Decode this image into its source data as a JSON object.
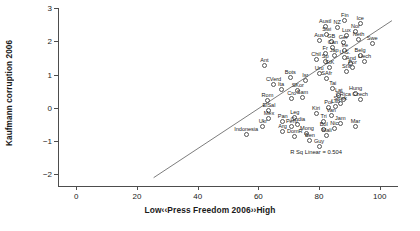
{
  "chart_data": {
    "type": "scatter",
    "title": "",
    "xlabel": "Low‹‹Press Freedom 2006››High",
    "ylabel": "Kaufmann corruption 2006",
    "xlim": [
      -6,
      106
    ],
    "ylim": [
      -2.35,
      3.0
    ],
    "xticks": [
      0,
      20,
      40,
      60,
      80,
      100
    ],
    "yticks": [
      -2,
      -1,
      0,
      1,
      2,
      3
    ],
    "grid": false,
    "legend": null,
    "annotations": [
      {
        "text": "R Sq Linear = 0.504",
        "x": 79,
        "y": -1.32
      }
    ],
    "fit": {
      "type": "linear",
      "r_squared": 0.504,
      "x_start": 25.5,
      "y_start": -2.1,
      "x_end": 104,
      "y_end": 2.62
    },
    "points": [
      {
        "label": "Fin",
        "x": 88.5,
        "y": 2.62
      },
      {
        "label": "Ice",
        "x": 93.5,
        "y": 2.54
      },
      {
        "label": "Nor",
        "x": 92.0,
        "y": 2.3
      },
      {
        "label": "NZ",
        "x": 86.0,
        "y": 2.4
      },
      {
        "label": "Austl",
        "x": 82.0,
        "y": 2.45
      },
      {
        "label": "Swi",
        "x": 82.5,
        "y": 2.2
      },
      {
        "label": "Lux",
        "x": 89.0,
        "y": 2.18
      },
      {
        "label": "Neth",
        "x": 93.0,
        "y": 2.05
      },
      {
        "label": "Ger",
        "x": 88.0,
        "y": 1.96
      },
      {
        "label": "GB",
        "x": 84.0,
        "y": 1.98
      },
      {
        "label": "Aus",
        "x": 80.0,
        "y": 2.02
      },
      {
        "label": "Swe",
        "x": 97.5,
        "y": 1.92
      },
      {
        "label": "Can",
        "x": 84.5,
        "y": 1.8
      },
      {
        "label": "Ire",
        "x": 88.5,
        "y": 1.72
      },
      {
        "label": "Fr",
        "x": 82.0,
        "y": 1.62
      },
      {
        "label": "Jap",
        "x": 85.0,
        "y": 1.58
      },
      {
        "label": "U.S.",
        "x": 88.5,
        "y": 1.52
      },
      {
        "label": "Belg",
        "x": 93.5,
        "y": 1.58
      },
      {
        "label": "Liech",
        "x": 95.0,
        "y": 1.4
      },
      {
        "label": "And",
        "x": 90.5,
        "y": 1.34
      },
      {
        "label": "Por",
        "x": 91.0,
        "y": 1.2
      },
      {
        "label": "StV",
        "x": 89.0,
        "y": 1.1
      },
      {
        "label": "Sp",
        "x": 82.0,
        "y": 1.38
      },
      {
        "label": "Chil",
        "x": 79.0,
        "y": 1.44
      },
      {
        "label": "StK",
        "x": 83.5,
        "y": 1.22
      },
      {
        "label": "Ant",
        "x": 62.0,
        "y": 1.26
      },
      {
        "label": "Uru",
        "x": 80.0,
        "y": 1.02
      },
      {
        "label": "SAfr",
        "x": 82.5,
        "y": 0.88
      },
      {
        "label": "Isr",
        "x": 75.5,
        "y": 0.82
      },
      {
        "label": "Bots",
        "x": 70.5,
        "y": 0.92
      },
      {
        "label": "CVerd",
        "x": 65.0,
        "y": 0.7
      },
      {
        "label": "Ita",
        "x": 67.5,
        "y": 0.55
      },
      {
        "label": "SKor",
        "x": 73.0,
        "y": 0.52
      },
      {
        "label": "Tai",
        "x": 84.5,
        "y": 0.58
      },
      {
        "label": "Lat",
        "x": 86.5,
        "y": 0.36
      },
      {
        "label": "Hung",
        "x": 92.0,
        "y": 0.42
      },
      {
        "label": "Czech",
        "x": 93.5,
        "y": 0.26
      },
      {
        "label": "CRica",
        "x": 88.0,
        "y": 0.24
      },
      {
        "label": "Slovk",
        "x": 87.0,
        "y": 0.12
      },
      {
        "label": "Lith",
        "x": 85.5,
        "y": 0.04
      },
      {
        "label": "Pol",
        "x": 83.0,
        "y": 0.0
      },
      {
        "label": "Sam",
        "x": 74.5,
        "y": 0.3
      },
      {
        "label": "Cro",
        "x": 71.0,
        "y": 0.28
      },
      {
        "label": "Rom",
        "x": 63.0,
        "y": 0.22
      },
      {
        "label": "ElSal",
        "x": 63.5,
        "y": -0.08
      },
      {
        "label": "Kiri",
        "x": 79.0,
        "y": -0.16
      },
      {
        "label": "Van",
        "x": 84.0,
        "y": -0.22
      },
      {
        "label": "Tri",
        "x": 81.5,
        "y": -0.42
      },
      {
        "label": "Jam",
        "x": 87.0,
        "y": -0.46
      },
      {
        "label": "Mar",
        "x": 92.0,
        "y": -0.56
      },
      {
        "label": "Nic",
        "x": 85.0,
        "y": -0.62
      },
      {
        "label": "Bol",
        "x": 81.5,
        "y": -0.64
      },
      {
        "label": "Mali",
        "x": 82.5,
        "y": -0.82
      },
      {
        "label": "Mong",
        "x": 76.0,
        "y": -0.78
      },
      {
        "label": "Ben",
        "x": 77.0,
        "y": -0.98
      },
      {
        "label": "Guy",
        "x": 80.0,
        "y": -1.16
      },
      {
        "label": "Mex",
        "x": 63.5,
        "y": -0.32
      },
      {
        "label": "Pan",
        "x": 68.0,
        "y": -0.4
      },
      {
        "label": "Leg",
        "x": 72.0,
        "y": -0.3
      },
      {
        "label": "Gndia",
        "x": 73.0,
        "y": -0.5
      },
      {
        "label": "Peru",
        "x": 71.0,
        "y": -0.56
      },
      {
        "label": "Ukr",
        "x": 61.5,
        "y": -0.56
      },
      {
        "label": "Arg",
        "x": 68.0,
        "y": -0.72
      },
      {
        "label": "DomR",
        "x": 72.0,
        "y": -0.86
      },
      {
        "label": "Indonesia",
        "x": 56.0,
        "y": -0.8
      }
    ]
  }
}
